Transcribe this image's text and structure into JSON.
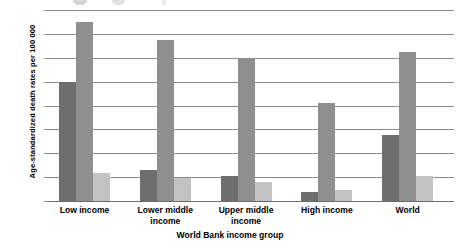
{
  "chart_data": {
    "type": "bar",
    "title": "",
    "xlabel": "World Bank income group",
    "ylabel": "Age-standardized death rates per 100 000",
    "categories": [
      "Low income",
      "Lower middle\nincome",
      "Upper middle\nincome",
      "High income",
      "World"
    ],
    "series": [
      {
        "name": "series-1",
        "color": "#6e6e6e",
        "values": [
          500,
          128,
          103,
          38,
          275
        ]
      },
      {
        "name": "series-2",
        "color": "#8f8f8f",
        "values": [
          750,
          675,
          598,
          410,
          625
        ]
      },
      {
        "name": "series-3",
        "color": "#c2c2c2",
        "values": [
          118,
          95,
          78,
          45,
          105
        ]
      }
    ],
    "ylim": [
      0,
      800
    ],
    "ytick_labels": [
      "800",
      "700",
      "600",
      "500",
      "400",
      "300",
      "200",
      "100",
      "0"
    ],
    "ytick_values": [
      800,
      700,
      600,
      500,
      400,
      300,
      200,
      100,
      0
    ],
    "grid": true,
    "legend_position": "top-cropped",
    "orientation": "vertical"
  },
  "axes": {
    "y_title": "Age-standardized death rates per 100 000",
    "x_title": "World Bank income group"
  },
  "category_labels": [
    {
      "line1": "Low income",
      "line2": ""
    },
    {
      "line1": "Lower middle",
      "line2": "income"
    },
    {
      "line1": "Upper middle",
      "line2": "income"
    },
    {
      "line1": "High income",
      "line2": ""
    },
    {
      "line1": "World",
      "line2": ""
    }
  ]
}
